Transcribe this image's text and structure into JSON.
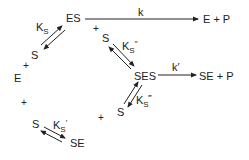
{
  "species": {
    "es": "ES",
    "e_plus_p": "E + P",
    "e": "E",
    "ses": "SES",
    "se_plus_p": "SE + P",
    "se": "SE",
    "s1": "S",
    "s2": "S",
    "s3": "S",
    "s4": "S"
  },
  "plus": [
    "+",
    "+",
    "+",
    "+"
  ],
  "constants": {
    "k": "k",
    "k_prime": "k′",
    "ks_main": "K",
    "ks_sub": "S",
    "ks_prime_main": "K",
    "ks_prime_sub": "S",
    "ks_prime_mark": "′",
    "ks_dprime_main": "K",
    "ks_dprime_sub": "S",
    "ks_dprime_mark": "″",
    "ks_tprime_main": "K",
    "ks_tprime_sub": "S",
    "ks_tprime_mark": "‴"
  }
}
